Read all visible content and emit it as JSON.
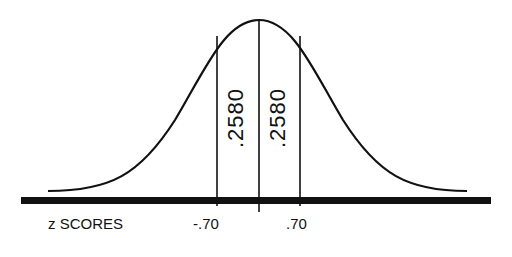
{
  "diagram": {
    "type": "normal-distribution",
    "axis_label": "z SCORES",
    "ticks": [
      {
        "label": "-.70",
        "z": -0.7
      },
      {
        "label": ".70",
        "z": 0.7
      }
    ],
    "areas": [
      {
        "label": ".2580",
        "from_z": -0.7,
        "to_z": 0
      },
      {
        "label": ".2580",
        "from_z": 0,
        "to_z": 0.7
      }
    ]
  }
}
